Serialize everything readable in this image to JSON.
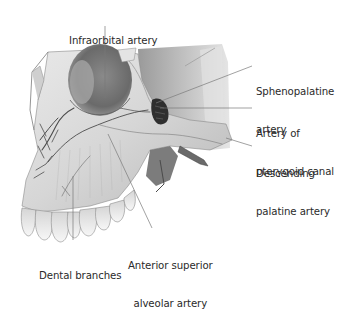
{
  "figure": {
    "colors": {
      "background": "#ffffff",
      "bone_light": "#ececec",
      "bone_mid": "#bdbdbd",
      "bone_dark": "#6e6e6e",
      "shadow": "#3a3a3a",
      "leader_line": "#7a7a7a",
      "label_text": "#2a2a2a"
    },
    "labels": [
      {
        "id": "infraorbital",
        "lines": [
          "Infraorbital artery"
        ],
        "x": 69,
        "y": 10
      },
      {
        "id": "sphenopalatine",
        "lines": [
          "Sphenopalatine",
          "artery"
        ],
        "x": 256,
        "y": 61
      },
      {
        "id": "pterygoid-canal",
        "lines": [
          "Artery of",
          "pterygoid canal"
        ],
        "x": 256,
        "y": 103
      },
      {
        "id": "descending-palatine",
        "lines": [
          "Descending",
          "palatine artery"
        ],
        "x": 256,
        "y": 143
      },
      {
        "id": "dental-branches",
        "lines": [
          "Dental branches"
        ],
        "x": 39,
        "y": 245
      },
      {
        "id": "anterior-superior-alveolar",
        "lines": [
          "Anterior superior",
          "alveolar artery"
        ],
        "x": 128,
        "y": 235
      }
    ]
  }
}
